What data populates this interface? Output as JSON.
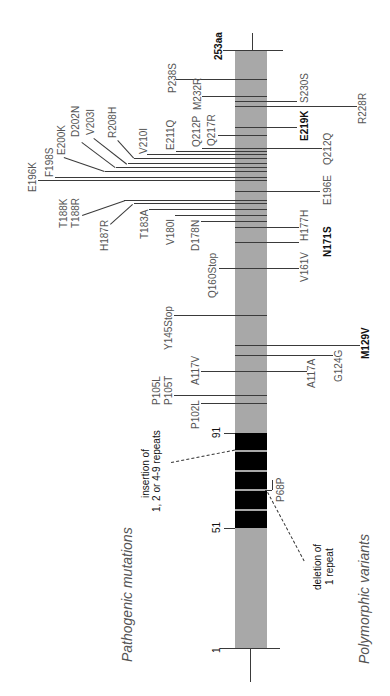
{
  "titles": {
    "pathogenic": "Pathogenic mutations",
    "polymorphic": "Polymorphic variants"
  },
  "axis": {
    "start": "1",
    "end": "253aa",
    "repeat_start": "51",
    "repeat_end": "91"
  },
  "annotations": {
    "insertion_line1": "insertion of",
    "insertion_line2": "1, 2 or 4-9 repeats",
    "deletion_line1": "deletion of",
    "deletion_line2": "1 repeat"
  },
  "pathogenic": [
    {
      "label": "P238S"
    },
    {
      "label": "M232R"
    },
    {
      "label": "Q217R"
    },
    {
      "label": "Q212P"
    },
    {
      "label": "E211Q"
    },
    {
      "label": "V210I"
    },
    {
      "label": "R208H"
    },
    {
      "label": "V203I"
    },
    {
      "label": "D202N"
    },
    {
      "label": "E200K"
    },
    {
      "label": "F198S"
    },
    {
      "label": "E196K"
    },
    {
      "label": "T188K"
    },
    {
      "label": "T188R"
    },
    {
      "label": "H187R"
    },
    {
      "label": "T183A"
    },
    {
      "label": "V180I"
    },
    {
      "label": "D178N"
    },
    {
      "label": "Q160Stop"
    },
    {
      "label": "Y145Stop"
    },
    {
      "label": "A117V"
    },
    {
      "label": "P105L"
    },
    {
      "label": "P105T"
    },
    {
      "label": "P102L"
    }
  ],
  "polymorphic": [
    {
      "label": "S230S"
    },
    {
      "label": "R228R"
    },
    {
      "label": "E219K",
      "bold": true
    },
    {
      "label": "Q212Q"
    },
    {
      "label": "E196E"
    },
    {
      "label": "H177H"
    },
    {
      "label": "N171S",
      "bold": true
    },
    {
      "label": "V161V"
    },
    {
      "label": "M129V",
      "bold": true
    },
    {
      "label": "G124G"
    },
    {
      "label": "A117A"
    },
    {
      "label": "P68P"
    }
  ],
  "colors": {
    "bar": "#a8a8a8",
    "repeat": "#000000",
    "line": "#3a3a3a",
    "label": "#555555"
  }
}
